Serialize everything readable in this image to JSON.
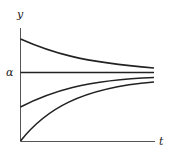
{
  "diagram": {
    "axes": {
      "y_label": "y",
      "x_label": "t",
      "equilibrium_label": "α"
    },
    "colors": {
      "axis": "#555555",
      "curve": "#222222",
      "background": "#ffffff"
    },
    "curves": [
      {
        "name": "above-equilibrium",
        "start_y": "above α",
        "behavior": "decreasing toward α"
      },
      {
        "name": "equilibrium",
        "start_y": "α",
        "behavior": "constant"
      },
      {
        "name": "below-equilibrium-1",
        "start_y": "below α",
        "behavior": "increasing toward α"
      },
      {
        "name": "below-equilibrium-2",
        "start_y": "0",
        "behavior": "increasing toward α"
      }
    ]
  }
}
